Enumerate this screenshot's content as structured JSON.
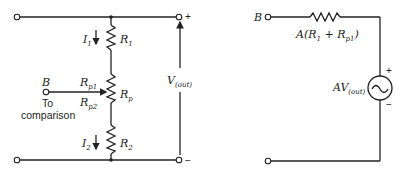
{
  "figure": {
    "left_circuit": {
      "labels": {
        "I1": "I",
        "I1_sub": "1",
        "R1": "R",
        "R1_sub": "1",
        "Rp1": "R",
        "Rp1_sub": "p1",
        "Rp": "R",
        "Rp_sub": "p",
        "Rp2": "R",
        "Rp2_sub": "p2",
        "R2": "R",
        "R2_sub": "2",
        "I2": "I",
        "I2_sub": "2",
        "B": "B",
        "to": "To",
        "comparison": "comparison",
        "Vout": "V",
        "Vout_sub": "(out)",
        "plus": "+",
        "minus": "−"
      }
    },
    "right_circuit": {
      "labels": {
        "B": "B",
        "resistor": "A(R",
        "resistor_sub1": "1",
        "resistor_mid": " + R",
        "resistor_sub2": "p1",
        "resistor_end": ")",
        "source": "AV",
        "source_sub": "(out)",
        "plus": "+",
        "minus": "−",
        "source_symbol": "~"
      }
    }
  }
}
